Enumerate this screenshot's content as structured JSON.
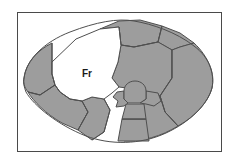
{
  "figure": {
    "title": "",
    "caption": "",
    "frame": {
      "border_color": "#4a4a4a",
      "background_color": "#ffffff",
      "x": 17,
      "y": 12,
      "width": 205,
      "height": 140
    },
    "palette": {
      "shaded_fill": "#9d9d9d",
      "highlight_fill": "#ffffff",
      "outline_stroke": "#4f4f4f",
      "label_color": "#1a1a1a"
    }
  },
  "diagram": {
    "type": "segmented-outline-map",
    "outline_path": "M 24 78 C 26 60 44 42 70 32 C 96 22 118 18 134 21 C 152 24 176 32 194 46 C 210 58 215 74 212 88 C 208 104 190 122 166 133 C 140 145 110 145 86 136 C 58 125 34 106 26 92 C 24 87 23 82 24 78 Z",
    "regions": [
      {
        "id": "region-frontal",
        "label": "Fr",
        "fill": "highlight",
        "label_x": 87,
        "label_y": 74,
        "path": "M 52 62 L 76 39 L 100 29 L 119 27 L 121 45 L 118 62 L 112 78 L 119 87 L 112 93 L 104 99 L 92 97 L 82 101 L 70 99 L 60 92 L 55 85 L 52 74 Z"
      },
      {
        "id": "region-left-lateral",
        "label": "",
        "fill": "shaded",
        "path": "M 24 78 C 26 62 38 50 52 43 L 52 62 L 52 74 L 55 85 L 40 95 L 28 92 C 24 87 23 82 24 78 Z"
      },
      {
        "id": "region-left-inferior",
        "label": "",
        "fill": "shaded",
        "path": "M 28 92 L 40 95 L 55 85 L 60 92 L 70 99 L 82 101 L 88 112 L 78 130 L 62 123 C 46 114 33 101 28 92 Z"
      },
      {
        "id": "region-inferior-left",
        "label": "",
        "fill": "shaded",
        "path": "M 82 101 L 92 97 L 104 99 L 110 110 L 104 132 L 92 140 L 78 130 L 88 112 Z"
      },
      {
        "id": "region-superior-anterior",
        "label": "",
        "fill": "shaded",
        "path": "M 100 29 L 119 21 L 140 20 L 162 26 L 158 42 L 134 47 L 121 45 L 119 27 Z"
      },
      {
        "id": "region-superior-posterior",
        "label": "",
        "fill": "shaded",
        "path": "M 162 26 L 180 33 L 194 43 L 180 47 L 172 50 L 158 42 Z"
      },
      {
        "id": "region-central-body",
        "label": "",
        "fill": "shaded",
        "path": "M 121 45 L 134 47 L 158 42 L 172 50 L 172 78 L 160 96 L 148 96 L 140 92 L 133 88 L 127 88 L 119 87 L 112 78 L 118 62 Z"
      },
      {
        "id": "region-posterior-lateral",
        "label": "",
        "fill": "shaded",
        "path": "M 172 50 L 180 47 L 194 43 C 208 56 215 73 212 88 C 208 102 196 116 178 126 L 165 112 L 160 96 L 172 78 Z"
      },
      {
        "id": "region-inferior-posterior",
        "label": "",
        "fill": "shaded",
        "path": "M 148 96 L 160 96 L 165 112 L 178 126 C 162 136 142 142 124 141 L 128 120 L 142 104 Z"
      },
      {
        "id": "region-dome-central",
        "label": "",
        "fill": "shaded",
        "path": "M 124 91 C 124 85 129 81 135 81 C 141 81 146 85 146 91 L 146 99 L 140 103 L 128 103 L 124 99 Z"
      },
      {
        "id": "region-wing-right",
        "label": "",
        "fill": "shaded",
        "path": "M 146 91 L 158 93 L 161 101 L 154 106 L 146 104 L 140 103 L 146 99 Z"
      },
      {
        "id": "region-wing-left",
        "label": "",
        "fill": "shaded",
        "path": "M 124 91 L 117 92 L 113 97 L 118 101 L 116 107 L 124 106 L 128 103 L 124 99 Z"
      },
      {
        "id": "region-stem-upper",
        "label": "",
        "fill": "shaded",
        "path": "M 126 104 L 144 104 L 146 119 L 122 119 Z"
      },
      {
        "id": "region-stem-lower",
        "label": "",
        "fill": "shaded",
        "path": "M 122 119 L 146 119 L 149 141 L 118 141 Z"
      }
    ],
    "divider_lines": [
      {
        "id": "divider-superior",
        "path": "M 119 27 L 121 45 L 134 47 L 158 42 L 162 26"
      },
      {
        "id": "divider-posterior",
        "path": "M 172 50 L 172 78 L 160 96 L 165 112 L 178 126"
      },
      {
        "id": "divider-left-upper",
        "path": "M 52 43 L 52 74 L 55 85 L 40 95 L 28 92"
      },
      {
        "id": "divider-left-lower",
        "path": "M 55 85 L 60 92 L 70 99 L 82 101 L 88 112 L 78 130"
      },
      {
        "id": "divider-inferior",
        "path": "M 104 99 L 110 110 L 104 132 L 92 140"
      },
      {
        "id": "divider-stem-mid",
        "path": "M 122 119 L 146 119"
      }
    ]
  }
}
